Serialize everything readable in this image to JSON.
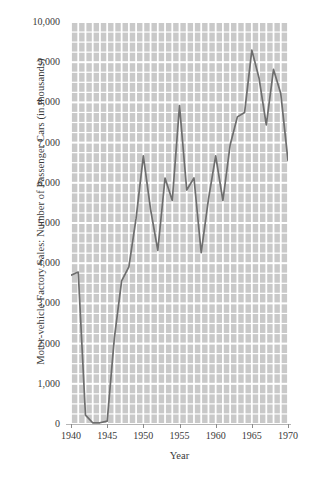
{
  "figure": {
    "xlabel": "Year",
    "ylabel": "Motor-vehicle Factory Sales: Number of Passenger Cars (in thousands)",
    "footer_fragment": ""
  },
  "chart_data": {
    "type": "line",
    "title": "",
    "xlabel": "Year",
    "ylabel": "Motor-vehicle Factory Sales: Number of Passenger Cars (in thousands)",
    "xlim": [
      1940,
      1970
    ],
    "ylim": [
      0,
      10000
    ],
    "grid": true,
    "legend_position": "none",
    "line_color": "#6e6e6e",
    "plot_background_color": "#c9c9c9",
    "gridline_color": "#ffffff",
    "text_color": "#3a3a3a",
    "xticks": [
      1940,
      1945,
      1950,
      1955,
      1960,
      1965,
      1970
    ],
    "xtick_labels": [
      "1940",
      "1945",
      "1950",
      "1955",
      "1960",
      "1965",
      "1970"
    ],
    "yticks": [
      0,
      1000,
      2000,
      3000,
      4000,
      5000,
      6000,
      7000,
      8000,
      9000,
      10000
    ],
    "ytick_labels": [
      "0",
      "1,000",
      "2,000",
      "3,000",
      "4,000",
      "5,000",
      "6,000",
      "7,000",
      "8,000",
      "9,000",
      "10,000"
    ],
    "y_minor_tick_interval": 250,
    "x_minor_tick_interval": 1,
    "x": [
      1940,
      1941,
      1942,
      1943,
      1944,
      1945,
      1946,
      1947,
      1948,
      1949,
      1950,
      1951,
      1952,
      1953,
      1954,
      1955,
      1956,
      1957,
      1958,
      1959,
      1960,
      1961,
      1962,
      1963,
      1964,
      1965,
      1966,
      1967,
      1968,
      1969,
      1970
    ],
    "values": [
      3700,
      3780,
      220,
      30,
      30,
      70,
      2150,
      3560,
      3910,
      5120,
      6670,
      5340,
      4320,
      6120,
      5560,
      7920,
      5820,
      6120,
      4260,
      5590,
      6670,
      5560,
      6940,
      7640,
      7750,
      9300,
      8600,
      7440,
      8820,
      8220,
      6550
    ]
  }
}
